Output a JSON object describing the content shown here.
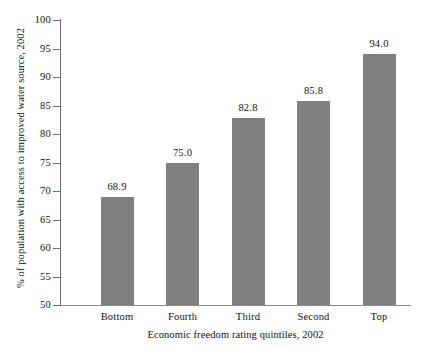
{
  "chart_data": {
    "type": "bar",
    "title": "",
    "categories": [
      "Bottom",
      "Fourth",
      "Third",
      "Second",
      "Top"
    ],
    "values": [
      68.9,
      75.0,
      82.8,
      85.8,
      94.0
    ],
    "value_labels": [
      "68.9",
      "75.0",
      "82.8",
      "85.8",
      "94.0"
    ],
    "xlabel": "Economic freedom rating quintiles, 2002",
    "ylabel": "% of population with access to improved water source, 2002",
    "ylim": [
      50,
      100
    ],
    "ytick_labels": [
      "100",
      "95",
      "90",
      "85",
      "80",
      "75",
      "70",
      "65",
      "60",
      "55",
      "50"
    ],
    "ytick_values": [
      100,
      95,
      90,
      85,
      80,
      75,
      70,
      65,
      60,
      55,
      50
    ],
    "grid": false,
    "legend": false,
    "bar_color": "#808080",
    "axis_color": "#6d6d6d",
    "background_color": "#ffffff"
  }
}
